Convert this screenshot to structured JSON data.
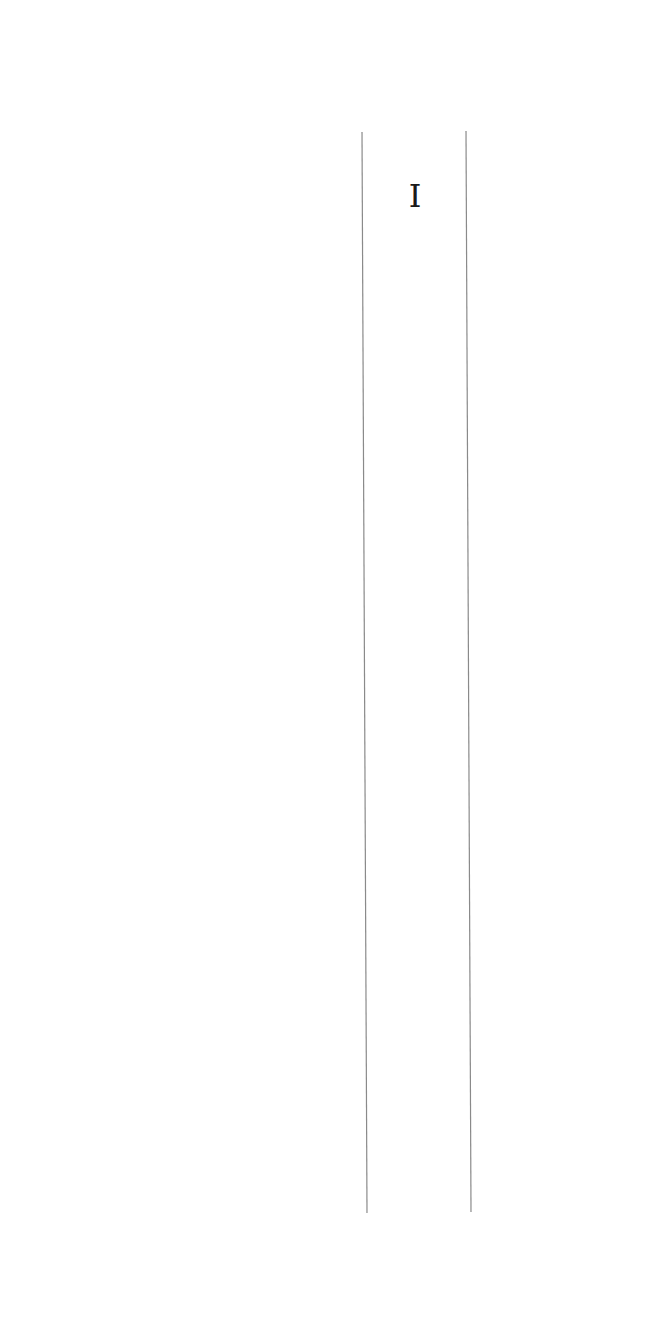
{
  "document": {
    "column": {
      "header_label": "I",
      "rule_color": "#8a8a8a",
      "left_rule": {
        "x1": 362,
        "y1": 132,
        "x2": 367,
        "y2": 1213
      },
      "right_rule": {
        "x1": 466,
        "y1": 131,
        "x2": 471,
        "y2": 1212
      }
    }
  }
}
